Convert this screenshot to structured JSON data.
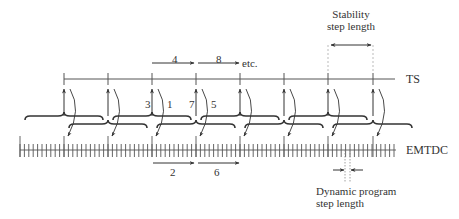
{
  "diagram": {
    "lines": {
      "ts": {
        "label": "TS"
      },
      "emtdc": {
        "label": "EMTDC"
      }
    },
    "annotations": {
      "stability_step": {
        "line1": "Stability",
        "line2": "step length"
      },
      "dynamic_step": {
        "line1": "Dynamic program",
        "line2": "step length"
      },
      "etc": "etc."
    },
    "sequence_labels": {
      "top": [
        "4",
        "8"
      ],
      "bottom": [
        "2",
        "6"
      ],
      "near_ts": [
        "3",
        "1",
        "7",
        "5"
      ]
    },
    "colors": {
      "stroke": "#333333",
      "light": "#999999"
    }
  }
}
